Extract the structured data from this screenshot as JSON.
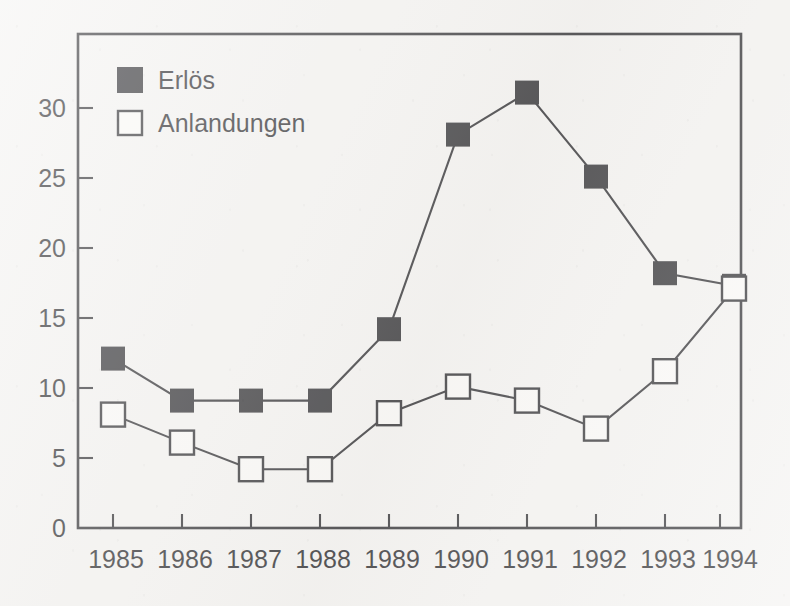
{
  "chart_data": {
    "type": "line",
    "title": "",
    "xlabel": "",
    "ylabel": "",
    "grid": false,
    "legend_position": "top-left-inside",
    "categories": [
      "1985",
      "1986",
      "1987",
      "1988",
      "1989",
      "1990",
      "1991",
      "1992",
      "1993",
      "1994"
    ],
    "x": [
      1985,
      1986,
      1987,
      1988,
      1989,
      1990,
      1991,
      1992,
      1993,
      1994
    ],
    "xlim": [
      1984.5,
      1994.7
    ],
    "ylim": [
      0,
      34
    ],
    "yticks": [
      0,
      5,
      10,
      15,
      20,
      25,
      30
    ],
    "ytick_labels": [
      "0",
      "5",
      "10",
      "15",
      "20",
      "25",
      "30"
    ],
    "series": [
      {
        "name": "Erlös",
        "marker": "filled-square",
        "color": "#16161a",
        "values": [
          12.1,
          9.1,
          9.1,
          9.1,
          14.2,
          28.1,
          31.1,
          25.1,
          18.2,
          17.3
        ]
      },
      {
        "name": "Anlandungen",
        "marker": "open-square",
        "color": "#16161a",
        "values": [
          8.1,
          6.1,
          4.2,
          4.2,
          8.2,
          10.1,
          9.1,
          7.1,
          11.2,
          17.1
        ]
      }
    ]
  },
  "legend": {
    "items": [
      {
        "label": "Erlös",
        "marker": "filled-square"
      },
      {
        "label": "Anlandungen",
        "marker": "open-square"
      }
    ]
  },
  "axes": {
    "y_tick_labels": [
      "30",
      "25",
      "20",
      "15",
      "10",
      "5",
      "0"
    ],
    "x_tick_labels": [
      "1985",
      "1986",
      "1987",
      "1988",
      "1989",
      "1990",
      "1991",
      "1992",
      "1993",
      "1994"
    ]
  },
  "colors": {
    "ink": "#16161a",
    "paper": "#f4f3f1",
    "marker_fill_open": "#fbfaf8"
  }
}
